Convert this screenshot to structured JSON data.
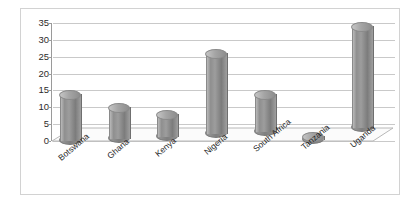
{
  "chart_data": {
    "type": "bar",
    "title": "",
    "subtitle": "",
    "xlabel": "",
    "ylabel": "",
    "categories": [
      "Botswana",
      "Ghana",
      "Kenya",
      "Nigeria",
      "South Africa",
      "Tanzania",
      "Uganda"
    ],
    "values": [
      14,
      10,
      8,
      26,
      14,
      1.5,
      34
    ],
    "series": [
      {
        "name": "",
        "values": [
          14,
          10,
          8,
          26,
          14,
          1.5,
          34
        ]
      }
    ],
    "ylim": [
      0,
      35
    ],
    "ytick_step": 5,
    "ytick_labels": [
      "0",
      "5",
      "10",
      "15",
      "20",
      "25",
      "30",
      "35"
    ],
    "grid": true,
    "legend": "none",
    "style": "3d-cylinder",
    "bar_color": "#8f8f8f",
    "grid_color": "#c9c9c9",
    "axis_color": "#9a9a9a",
    "border_color": "#d2d2d2",
    "background": "#ffffff"
  }
}
